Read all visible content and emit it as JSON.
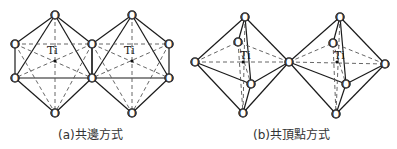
{
  "figure": {
    "captions": {
      "a": "(a)共邊方式",
      "b": "(b)共頂點方式"
    },
    "atom_labels": {
      "oxygen": "O",
      "titanium": "Ti"
    },
    "panels": [
      {
        "id": "a",
        "description": "Edge-sharing TiO6 octahedra",
        "octahedra": [
          {
            "ti": [
              55,
              61
            ],
            "top": [
              55,
              15
            ],
            "bottom": [
              55,
              113
            ],
            "ul": [
              15,
              44
            ],
            "ll": [
              15,
              78
            ],
            "ur": [
              92,
              44
            ],
            "lr": [
              92,
              78
            ]
          },
          {
            "ti": [
              132,
              61
            ],
            "top": [
              132,
              15
            ],
            "bottom": [
              132,
              113
            ],
            "ul": [
              92,
              44
            ],
            "ll": [
              92,
              78
            ],
            "ur": [
              169,
              44
            ],
            "lr": [
              169,
              78
            ]
          }
        ]
      },
      {
        "id": "b",
        "description": "Corner-sharing TiO6 octahedra",
        "octahedra": [
          {
            "ti": [
              243,
              62
            ],
            "top": [
              245,
              17
            ],
            "bottom": [
              243,
              113
            ],
            "left": [
              195,
              62
            ],
            "right": [
              289,
              62
            ],
            "back": [
              238,
              42
            ],
            "front": [
              251,
              84
            ]
          },
          {
            "ti": [
              337,
              62
            ],
            "top": [
              340,
              17
            ],
            "bottom": [
              336,
              114
            ],
            "left": [
              289,
              62
            ],
            "right": [
              385,
              64
            ],
            "back": [
              333,
              43
            ],
            "front": [
              346,
              84
            ]
          }
        ]
      }
    ]
  }
}
